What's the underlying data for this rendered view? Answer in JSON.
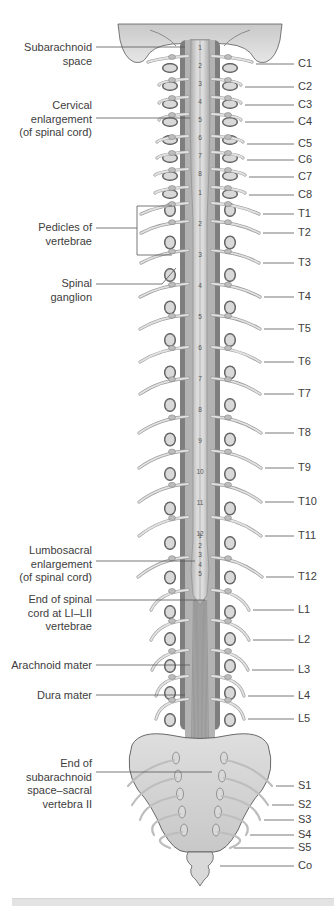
{
  "figure": {
    "colors": {
      "bone": "#d9d9d9",
      "bone_outline": "#5a5a5a",
      "cord": "#cfcfcf",
      "dura": "#8f8f8f",
      "nerve": "#c4c4c4",
      "leader_line": "#555555",
      "caption_bar": "#e3e3e3"
    },
    "left_labels": [
      {
        "id": "subarachnoid-space",
        "lines": [
          "Subarachnoid",
          "space"
        ],
        "y": 41,
        "line_y": 47,
        "line_to_x": 185
      },
      {
        "id": "cervical-enlargement",
        "lines": [
          "Cervical",
          "enlargement",
          "(of spinal cord)"
        ],
        "y": 99,
        "line_y": 118,
        "line_to_x": 190
      },
      {
        "id": "pedicles-of-vertebrae",
        "lines": [
          "Pedicles of",
          "vertebrae"
        ],
        "y": 221,
        "line_y": 228,
        "line_to_x": 137
      },
      {
        "id": "spinal-ganglion",
        "lines": [
          "Spinal",
          "ganglion"
        ],
        "y": 277,
        "line_y": 284,
        "line_to_x": 162
      },
      {
        "id": "lumbosacral-enlargement",
        "lines": [
          "Lumbosacral",
          "enlargement",
          "(of spinal cord)"
        ],
        "y": 544,
        "line_y": 561,
        "line_to_x": 195
      },
      {
        "id": "end-of-spinal-cord",
        "lines": [
          "End of spinal",
          "cord at LI–LII",
          "vertebrae"
        ],
        "y": 593,
        "line_y": 600,
        "line_to_x": 205
      },
      {
        "id": "arachnoid-mater",
        "lines": [
          "Arachnoid mater"
        ],
        "y": 659,
        "line_y": 665,
        "line_to_x": 190
      },
      {
        "id": "dura-mater",
        "lines": [
          "Dura mater"
        ],
        "y": 689,
        "line_y": 695,
        "line_to_x": 185
      },
      {
        "id": "end-of-subarachnoid-space",
        "lines": [
          "End of",
          "subarachnoid",
          "space–sacral",
          "vertebra II"
        ],
        "y": 757,
        "line_y": 772,
        "line_to_x": 212
      }
    ],
    "right_labels": [
      {
        "id": "C1",
        "text": "C1",
        "y": 64,
        "line_from_x": 256
      },
      {
        "id": "C2",
        "text": "C2",
        "y": 87,
        "line_from_x": 245
      },
      {
        "id": "C3",
        "text": "C3",
        "y": 105,
        "line_from_x": 245
      },
      {
        "id": "C4",
        "text": "C4",
        "y": 122,
        "line_from_x": 245
      },
      {
        "id": "C5",
        "text": "C5",
        "y": 144,
        "line_from_x": 247
      },
      {
        "id": "C6",
        "text": "C6",
        "y": 160,
        "line_from_x": 247
      },
      {
        "id": "C7",
        "text": "C7",
        "y": 177,
        "line_from_x": 249
      },
      {
        "id": "C8",
        "text": "C8",
        "y": 195,
        "line_from_x": 249
      },
      {
        "id": "T1",
        "text": "T1",
        "y": 214,
        "line_from_x": 263
      },
      {
        "id": "T2",
        "text": "T2",
        "y": 233,
        "line_from_x": 263
      },
      {
        "id": "T3",
        "text": "T3",
        "y": 263,
        "line_from_x": 263
      },
      {
        "id": "T4",
        "text": "T4",
        "y": 297,
        "line_from_x": 264
      },
      {
        "id": "T5",
        "text": "T5",
        "y": 329,
        "line_from_x": 264
      },
      {
        "id": "T6",
        "text": "T6",
        "y": 362,
        "line_from_x": 264
      },
      {
        "id": "T7",
        "text": "T7",
        "y": 394,
        "line_from_x": 264
      },
      {
        "id": "T8",
        "text": "T8",
        "y": 433,
        "line_from_x": 265
      },
      {
        "id": "T9",
        "text": "T9",
        "y": 468,
        "line_from_x": 265
      },
      {
        "id": "T10",
        "text": "T10",
        "y": 502,
        "line_from_x": 265
      },
      {
        "id": "T11",
        "text": "T11",
        "y": 536,
        "line_from_x": 265
      },
      {
        "id": "T12",
        "text": "T12",
        "y": 577,
        "line_from_x": 266
      },
      {
        "id": "L1",
        "text": "L1",
        "y": 610,
        "line_from_x": 253
      },
      {
        "id": "L2",
        "text": "L2",
        "y": 640,
        "line_from_x": 253
      },
      {
        "id": "L3",
        "text": "L3",
        "y": 670,
        "line_from_x": 252
      },
      {
        "id": "L4",
        "text": "L4",
        "y": 696,
        "line_from_x": 248
      },
      {
        "id": "L5",
        "text": "L5",
        "y": 719,
        "line_from_x": 248
      },
      {
        "id": "S1",
        "text": "S1",
        "y": 786,
        "line_from_x": 276
      },
      {
        "id": "S2",
        "text": "S2",
        "y": 805,
        "line_from_x": 272
      },
      {
        "id": "S3",
        "text": "S3",
        "y": 820,
        "line_from_x": 264
      },
      {
        "id": "S4",
        "text": "S4",
        "y": 835,
        "line_from_x": 250
      },
      {
        "id": "S5",
        "text": "S5",
        "y": 848,
        "line_from_x": 234
      },
      {
        "id": "Co",
        "text": "Co",
        "y": 866,
        "line_from_x": 220
      }
    ],
    "cord_segment_numbers": {
      "cervical": [
        "1",
        "2",
        "3",
        "4",
        "5",
        "6",
        "7",
        "8"
      ],
      "thoracic": [
        "1",
        "2",
        "3",
        "4",
        "5",
        "6",
        "7",
        "8",
        "9",
        "10",
        "11",
        "12"
      ],
      "lumbar": [
        "1",
        "2",
        "3",
        "4",
        "5"
      ]
    },
    "caption": ""
  }
}
